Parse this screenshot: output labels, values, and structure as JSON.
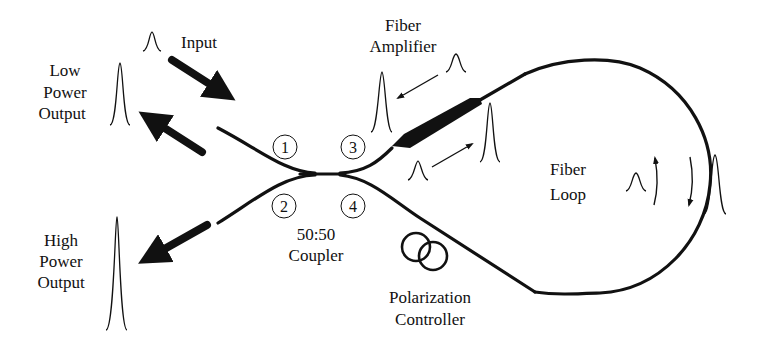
{
  "diagram": {
    "labels": {
      "input": "Input",
      "low_power_output": [
        "Low",
        "Power",
        "Output"
      ],
      "high_power_output": [
        "High",
        "Power",
        "Output"
      ],
      "fiber_amplifier": [
        "Fiber",
        "Amplifier"
      ],
      "fiber_loop": [
        "Fiber",
        "Loop"
      ],
      "coupler": [
        "50:50",
        "Coupler"
      ],
      "polarization_controller": [
        "Polarization",
        "Controller"
      ]
    },
    "ports": [
      "1",
      "2",
      "3",
      "4"
    ],
    "colors": {
      "line": "#111111",
      "background": "#ffffff"
    }
  }
}
